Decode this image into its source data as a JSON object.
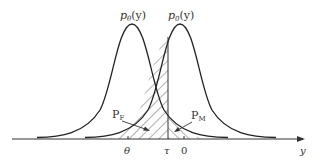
{
  "diagram": {
    "type": "two overlapping gaussian densities with decision threshold",
    "curves": [
      {
        "label": "p_θ(y)",
        "label_main": "p",
        "label_sub": "θ",
        "label_arg": "(y)",
        "mean_label": "θ"
      },
      {
        "label": "p_0(y)",
        "label_main": "p",
        "label_sub": "0",
        "label_arg": "(y)",
        "mean_label": "0"
      }
    ],
    "threshold_label": "τ",
    "axis_label": "y",
    "regions": [
      {
        "label": "P_F",
        "main": "P",
        "sub": "F"
      },
      {
        "label": "P_M",
        "main": "P",
        "sub": "M"
      }
    ],
    "ticks": [
      "θ",
      "τ",
      "0"
    ]
  }
}
